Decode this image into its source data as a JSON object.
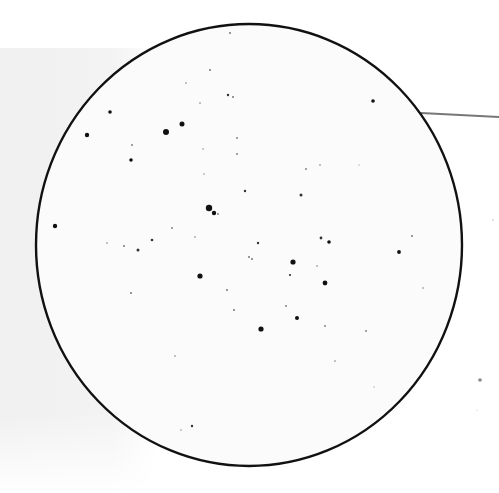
{
  "sketch": {
    "title": "",
    "field_circle": {
      "cx": 249,
      "cy": 245,
      "rx": 213,
      "ry": 221,
      "stroke": "#111111",
      "fill": "#fbfbfb"
    },
    "pointer_line": {
      "x1": 421,
      "y1": 113,
      "x2": 499,
      "y2": 117,
      "stroke": "#777777"
    },
    "background_panel_color": "#f1f1f1",
    "stars": [
      {
        "x": 230,
        "y": 33,
        "r": 1.0
      },
      {
        "x": 210,
        "y": 70,
        "r": 1.0
      },
      {
        "x": 186,
        "y": 83,
        "r": 0.8
      },
      {
        "x": 228,
        "y": 95,
        "r": 1.2
      },
      {
        "x": 233,
        "y": 97,
        "r": 1.0
      },
      {
        "x": 200,
        "y": 103,
        "r": 0.8
      },
      {
        "x": 373,
        "y": 101,
        "r": 1.8
      },
      {
        "x": 110,
        "y": 112,
        "r": 1.8
      },
      {
        "x": 182,
        "y": 124,
        "r": 2.5
      },
      {
        "x": 87,
        "y": 135,
        "r": 2.2
      },
      {
        "x": 166,
        "y": 132,
        "r": 3.0
      },
      {
        "x": 132,
        "y": 145,
        "r": 0.9
      },
      {
        "x": 237,
        "y": 138,
        "r": 0.9
      },
      {
        "x": 237,
        "y": 154,
        "r": 0.9
      },
      {
        "x": 131,
        "y": 160,
        "r": 1.8
      },
      {
        "x": 203,
        "y": 149,
        "r": 0.7
      },
      {
        "x": 204,
        "y": 174,
        "r": 0.7
      },
      {
        "x": 306,
        "y": 169,
        "r": 0.9
      },
      {
        "x": 320,
        "y": 165,
        "r": 0.8
      },
      {
        "x": 359,
        "y": 165,
        "r": 0.6
      },
      {
        "x": 245,
        "y": 191,
        "r": 1.2
      },
      {
        "x": 301,
        "y": 195,
        "r": 1.5
      },
      {
        "x": 209,
        "y": 208,
        "r": 3.2
      },
      {
        "x": 214,
        "y": 213,
        "r": 2.2
      },
      {
        "x": 218,
        "y": 214,
        "r": 0.9
      },
      {
        "x": 55,
        "y": 226,
        "r": 2.2
      },
      {
        "x": 172,
        "y": 228,
        "r": 0.9
      },
      {
        "x": 152,
        "y": 240,
        "r": 1.3
      },
      {
        "x": 107,
        "y": 243,
        "r": 0.8
      },
      {
        "x": 124,
        "y": 246,
        "r": 1.0
      },
      {
        "x": 138,
        "y": 250,
        "r": 1.5
      },
      {
        "x": 195,
        "y": 237,
        "r": 0.8
      },
      {
        "x": 258,
        "y": 243,
        "r": 1.2
      },
      {
        "x": 249,
        "y": 257,
        "r": 1.0
      },
      {
        "x": 252,
        "y": 259,
        "r": 1.0
      },
      {
        "x": 321,
        "y": 238,
        "r": 1.4
      },
      {
        "x": 329,
        "y": 242,
        "r": 1.8
      },
      {
        "x": 412,
        "y": 236,
        "r": 1.0
      },
      {
        "x": 399,
        "y": 252,
        "r": 1.9
      },
      {
        "x": 293,
        "y": 262,
        "r": 2.6
      },
      {
        "x": 290,
        "y": 275,
        "r": 1.1
      },
      {
        "x": 317,
        "y": 266,
        "r": 0.8
      },
      {
        "x": 200,
        "y": 276,
        "r": 2.6
      },
      {
        "x": 325,
        "y": 283,
        "r": 2.4
      },
      {
        "x": 423,
        "y": 288,
        "r": 0.8
      },
      {
        "x": 131,
        "y": 293,
        "r": 1.0
      },
      {
        "x": 227,
        "y": 290,
        "r": 1.0
      },
      {
        "x": 234,
        "y": 310,
        "r": 1.0
      },
      {
        "x": 286,
        "y": 306,
        "r": 0.9
      },
      {
        "x": 297,
        "y": 318,
        "r": 2.0
      },
      {
        "x": 261,
        "y": 329,
        "r": 2.6
      },
      {
        "x": 325,
        "y": 326,
        "r": 0.9
      },
      {
        "x": 366,
        "y": 331,
        "r": 0.9
      },
      {
        "x": 335,
        "y": 361,
        "r": 0.8
      },
      {
        "x": 175,
        "y": 356,
        "r": 0.8
      },
      {
        "x": 374,
        "y": 387,
        "r": 0.6
      },
      {
        "x": 192,
        "y": 426,
        "r": 1.2
      },
      {
        "x": 181,
        "y": 430,
        "r": 0.7
      }
    ],
    "outside_marks": [
      {
        "x": 480,
        "y": 380,
        "r": 1.8,
        "color": "#888888"
      },
      {
        "x": 493,
        "y": 220,
        "r": 0.7,
        "color": "#aaaaaa"
      },
      {
        "x": 477,
        "y": 410,
        "r": 0.6,
        "color": "#bbbbbb"
      }
    ]
  }
}
